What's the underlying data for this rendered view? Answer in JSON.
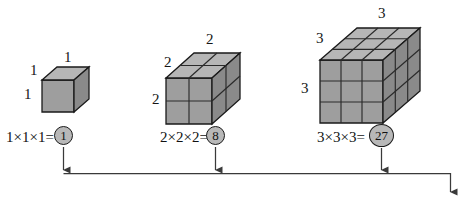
{
  "diagram": {
    "colors": {
      "front_face": "#9e9e9e",
      "top_face": "#b4b4b4",
      "side_face": "#8a8a8a",
      "outline": "#1a1a1a",
      "grid_line": "#2a2a2a",
      "circle_fill": "#b8b8b8",
      "arrow": "#3a3a3a",
      "background": "#ffffff",
      "text": "#111111"
    },
    "groups": [
      {
        "id": "cube-1",
        "n": 1,
        "dim_labels": [
          "1",
          "1",
          "1"
        ],
        "equation_text": "1×1×1=",
        "result": "1",
        "result_circled": true
      },
      {
        "id": "cube-2",
        "n": 2,
        "dim_labels": [
          "2",
          "2",
          "2"
        ],
        "equation_text": "2×2×2=",
        "result": "8",
        "result_circled": true
      },
      {
        "id": "cube-3",
        "n": 3,
        "dim_labels": [
          "3",
          "3",
          "3"
        ],
        "equation_text": "3×3×3=",
        "result": "27",
        "result_circled": true
      }
    ],
    "flow": {
      "description": "Three downward arrows merge onto a horizontal rail that turns down at the right into a final arrow",
      "arrow_icon": "arrow-down-icon"
    }
  }
}
